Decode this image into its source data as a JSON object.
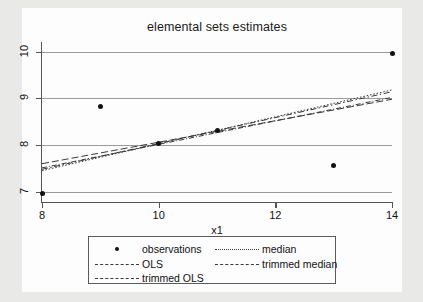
{
  "chart_data": {
    "type": "scatter",
    "title": "elemental sets estimates",
    "xlabel": "x1",
    "ylabel": "",
    "xlim": [
      8,
      14
    ],
    "ylim": [
      6.78,
      10.12
    ],
    "grid": true,
    "xticks": [
      "8",
      "10",
      "12",
      "14"
    ],
    "xtick_values": [
      8,
      10,
      12,
      14
    ],
    "yticks": [
      "7",
      "8",
      "9",
      "10"
    ],
    "ytick_values": [
      7,
      8,
      9,
      10
    ],
    "legend_position": "below",
    "points": [
      {
        "x": 8,
        "y": 6.97
      },
      {
        "x": 9,
        "y": 8.83
      },
      {
        "x": 10,
        "y": 8.03
      },
      {
        "x": 11,
        "y": 8.32
      },
      {
        "x": 13,
        "y": 7.56
      },
      {
        "x": 14,
        "y": 9.95
      }
    ],
    "series": [
      {
        "name": "observations",
        "style": "points",
        "x": [
          8,
          9,
          10,
          11,
          13,
          14
        ],
        "values": [
          6.97,
          8.83,
          8.03,
          8.32,
          7.56,
          9.95
        ]
      },
      {
        "name": "OLS",
        "style": "dashed",
        "x": [
          8,
          14
        ],
        "values": [
          7.6,
          8.98
        ]
      },
      {
        "name": "trimmed OLS",
        "style": "dashdot",
        "x": [
          8,
          14
        ],
        "values": [
          7.48,
          9.14
        ]
      },
      {
        "name": "median",
        "style": "dotted",
        "x": [
          8,
          14
        ],
        "values": [
          7.45,
          9.18
        ]
      },
      {
        "name": "trimmed median",
        "style": "dashdot2",
        "x": [
          8,
          14
        ],
        "values": [
          7.51,
          9.02
        ]
      }
    ]
  },
  "chart": {
    "title": "elemental sets estimates",
    "x_axis_title": "x1",
    "y_tick_labels": [
      "7",
      "8",
      "9",
      "10"
    ],
    "x_tick_labels": [
      "8",
      "10",
      "12",
      "14"
    ]
  },
  "legend": {
    "entries": [
      {
        "label": "observations",
        "key": "marker-dot"
      },
      {
        "label": "median",
        "key": "line-dotted"
      },
      {
        "label": "OLS",
        "key": "line-dashed"
      },
      {
        "label": "trimmed median",
        "key": "line-dashdot"
      },
      {
        "label": "trimmed OLS",
        "key": "line-dashdot"
      }
    ]
  },
  "colors": {
    "background": "#e9e9e7",
    "plot_background": "#fdfdfd",
    "axis": "#555555",
    "gridline": "#9a9a9a",
    "marker": "#111111",
    "line": "#3a3a3a"
  }
}
